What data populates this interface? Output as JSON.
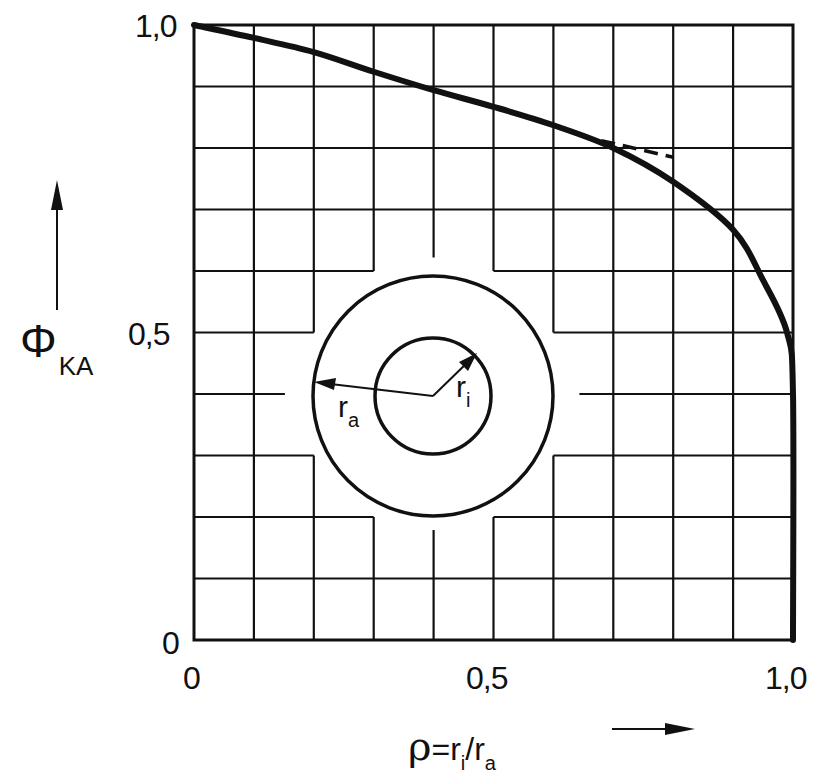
{
  "chart_data": {
    "type": "line",
    "title": "",
    "xlabel": "ρ = r_i / r_a",
    "ylabel": "Φ_KA",
    "xlim": [
      0,
      1.0
    ],
    "ylim": [
      0,
      1.0
    ],
    "grid": true,
    "grid_step": 0.1,
    "x_tick_labels": [
      "0",
      "0,5",
      "1,0"
    ],
    "y_tick_labels": [
      "0",
      "0,5",
      "1,0"
    ],
    "legend": null,
    "series": [
      {
        "name": "Φ_KA(ρ)",
        "style": "solid-thick",
        "x": [
          0,
          0.1,
          0.2,
          0.3,
          0.4,
          0.5,
          0.6,
          0.7,
          0.8,
          0.9,
          0.95,
          0.99,
          1.0,
          1.0
        ],
        "y": [
          1.0,
          0.979,
          0.956,
          0.924,
          0.894,
          0.867,
          0.837,
          0.8,
          0.745,
          0.667,
          0.585,
          0.5,
          0.4,
          0.0
        ]
      },
      {
        "name": "tangent-extension",
        "style": "dashed",
        "x": [
          0.68,
          0.8
        ],
        "y": [
          0.812,
          0.785
        ]
      }
    ],
    "annotations": [
      {
        "type": "inset-diagram",
        "description": "two concentric circles (annulus)",
        "labels": [
          "r_a",
          "r_i"
        ]
      }
    ]
  },
  "axes": {
    "y_ticks": {
      "top": "1,0",
      "mid": "0,5",
      "bottom": "0"
    },
    "x_ticks": {
      "left": "0",
      "mid": "0,5",
      "right": "1,0"
    },
    "y_label": {
      "main": "Φ",
      "sub": "KA"
    },
    "x_label": {
      "rho": "ρ",
      "eq": "=",
      "r1": "r",
      "sub1": "i",
      "slash": "/",
      "r2": "r",
      "sub2": "a"
    }
  },
  "inset": {
    "outer_label": {
      "main": "r",
      "sub": "a"
    },
    "inner_label": {
      "main": "r",
      "sub": "i"
    }
  },
  "colors": {
    "ink": "#111111",
    "background": "#ffffff"
  }
}
